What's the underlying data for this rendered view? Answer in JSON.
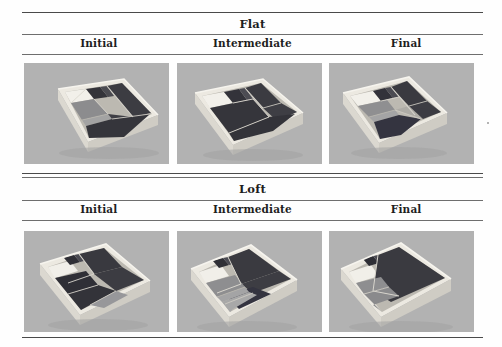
{
  "figure": {
    "kind": "results-table-figure",
    "background_color": "#fefefe",
    "rule_color": "#5a5a5a",
    "photo_background_color": "#b2b2b2"
  },
  "groups": [
    {
      "title": "Flat",
      "columns": [
        {
          "label": "Initial"
        },
        {
          "label": "Intermediate"
        },
        {
          "label": "Final"
        }
      ],
      "cells": [
        {
          "name": "flat-initial-photo",
          "caption": "Initial"
        },
        {
          "name": "flat-intermediate-photo",
          "caption": "Intermediate"
        },
        {
          "name": "flat-final-photo",
          "caption": "Final"
        }
      ]
    },
    {
      "title": "Loft",
      "columns": [
        {
          "label": "Initial"
        },
        {
          "label": "Intermediate"
        },
        {
          "label": "Final"
        }
      ],
      "cells": [
        {
          "name": "loft-initial-photo",
          "caption": "Initial"
        },
        {
          "name": "loft-intermediate-photo",
          "caption": "Intermediate"
        },
        {
          "name": "loft-final-photo",
          "caption": "Final"
        }
      ]
    }
  ],
  "palette": {
    "tray_top_light": "#f0efe9",
    "tray_side_light": "#dedcd4",
    "tray_side_shadow": "#c4c2ba",
    "panel_dark": "#3a3a3e",
    "panel_darker": "#2b2b30",
    "panel_mid": "#55555a",
    "panel_light": "#8d8d8f",
    "panel_lighter": "#a6a6a6",
    "photo_bg": "#b2b2b2",
    "seam": "#d9d7cf"
  }
}
